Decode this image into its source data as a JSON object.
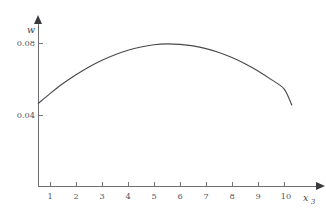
{
  "figure": {
    "background_color": "#ffffff",
    "axis_color": "#6e6e72",
    "curve_color": "#4a4a4e",
    "text_color": "#55555a"
  },
  "axes": {
    "y_axis_title": "w",
    "x_axis_title": "x",
    "x_axis_title_subscript": "3"
  },
  "chart_data": {
    "type": "line",
    "title": "",
    "xlabel": "x3",
    "ylabel": "w",
    "xlim": [
      0,
      11.05
    ],
    "ylim": [
      0,
      0.0944
    ],
    "grid": false,
    "legend": false,
    "x_ticks": [
      1,
      2,
      3,
      4,
      5,
      6,
      7,
      8,
      9,
      10
    ],
    "x_tick_labels": [
      "1",
      "2",
      "3",
      "4",
      "5",
      "6",
      "7",
      "8",
      "9",
      "10"
    ],
    "y_ticks": [
      0.04,
      0.08
    ],
    "y_tick_labels": [
      "0.04",
      "0.08"
    ],
    "series": [
      {
        "name": "w",
        "x": [
          0.55,
          1.0,
          1.5,
          2.0,
          2.5,
          3.0,
          3.5,
          4.0,
          4.5,
          5.0,
          5.5,
          6.0,
          6.5,
          7.0,
          7.5,
          8.0,
          8.5,
          9.0,
          9.5,
          10.0,
          10.3
        ],
        "y": [
          0.0465,
          0.0519,
          0.0575,
          0.0624,
          0.0667,
          0.0704,
          0.0735,
          0.076,
          0.0778,
          0.079,
          0.0795,
          0.0792,
          0.0784,
          0.0769,
          0.0747,
          0.0719,
          0.0685,
          0.0645,
          0.0598,
          0.0545,
          0.0455
        ]
      }
    ],
    "annotations": []
  }
}
